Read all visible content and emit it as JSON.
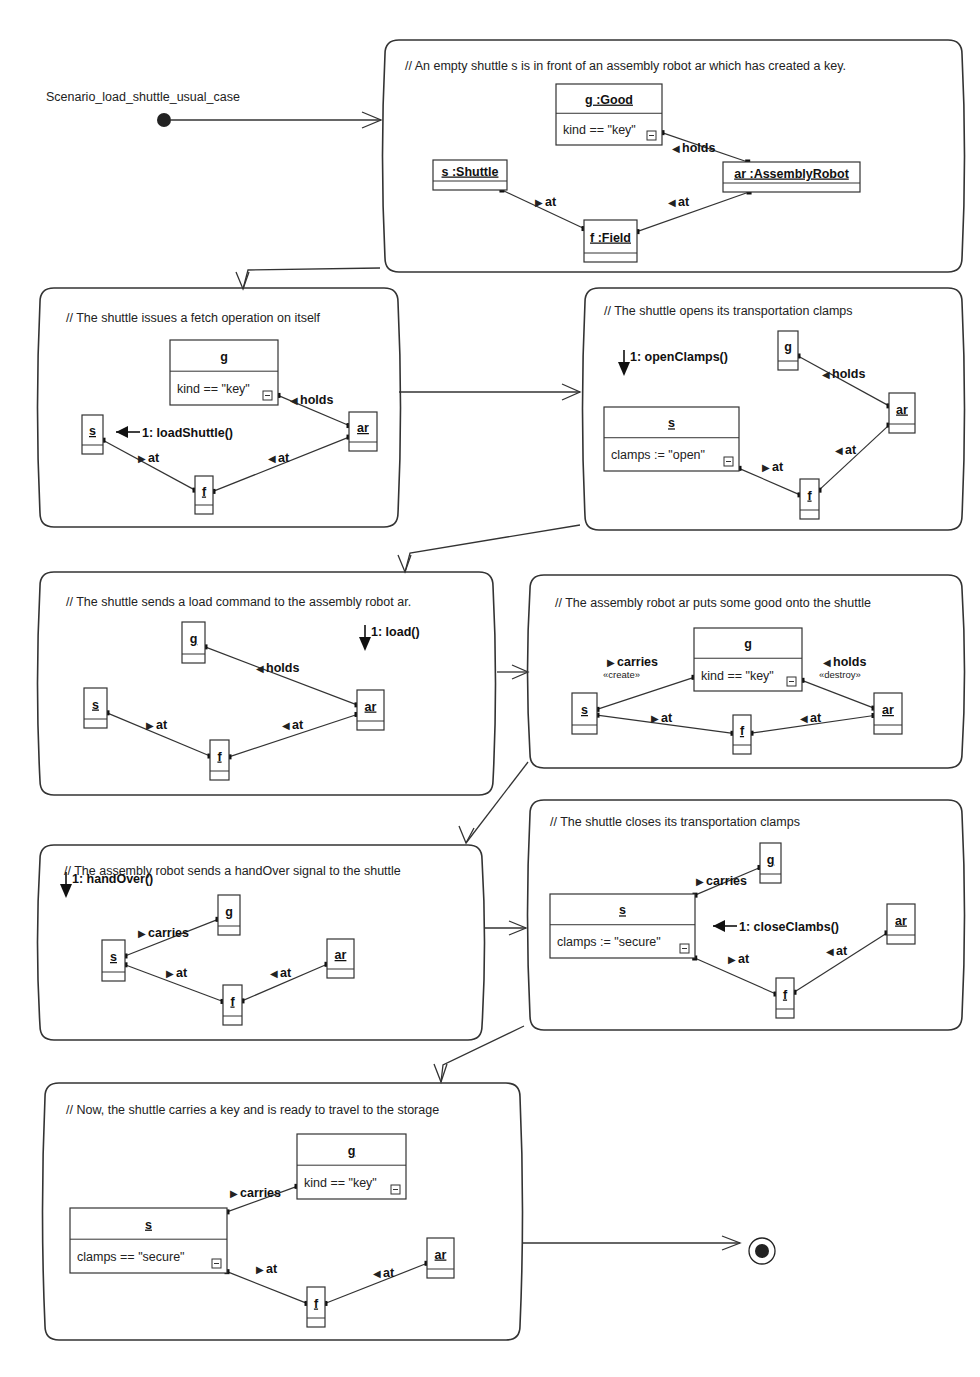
{
  "diagram": {
    "scenario_name": "Scenario_load_shuttle_usual_case",
    "frames": [
      {
        "id": "f1",
        "comment": "// An empty shuttle s is in front of an assembly robot ar which has created a key.",
        "objects": {
          "g": {
            "name": "g :Good",
            "attr": "kind == \"key\""
          },
          "s": {
            "name": "s :Shuttle"
          },
          "ar": {
            "name": "ar :AssemblyRobot"
          },
          "f": {
            "name": "f :Field"
          }
        },
        "links": [
          {
            "from": "g",
            "to": "ar",
            "label": "holds",
            "dir": "left"
          },
          {
            "from": "s",
            "to": "f",
            "label": "at",
            "dir": "right"
          },
          {
            "from": "ar",
            "to": "f",
            "label": "at",
            "dir": "left"
          }
        ]
      },
      {
        "id": "f2",
        "comment": "// The shuttle issues a fetch operation on itself",
        "objects": {
          "g": {
            "name": "g",
            "attr": "kind == \"key\""
          },
          "s": {
            "name": "s"
          },
          "ar": {
            "name": "ar"
          },
          "f": {
            "name": "f"
          }
        },
        "message": "1: loadShuttle()",
        "links": [
          {
            "from": "g",
            "to": "ar",
            "label": "holds",
            "dir": "left"
          },
          {
            "from": "s",
            "to": "f",
            "label": "at",
            "dir": "right"
          },
          {
            "from": "ar",
            "to": "f",
            "label": "at",
            "dir": "left"
          }
        ]
      },
      {
        "id": "f3",
        "comment": "// The shuttle opens its transportation clamps",
        "objects": {
          "g": {
            "name": "g"
          },
          "s": {
            "name": "s",
            "attr": "clamps := \"open\""
          },
          "ar": {
            "name": "ar"
          },
          "f": {
            "name": "f"
          }
        },
        "message": "1: openClamps()",
        "links": [
          {
            "from": "g",
            "to": "ar",
            "label": "holds",
            "dir": "left"
          },
          {
            "from": "s",
            "to": "f",
            "label": "at",
            "dir": "right"
          },
          {
            "from": "ar",
            "to": "f",
            "label": "at",
            "dir": "left"
          }
        ]
      },
      {
        "id": "f4",
        "comment": "// The shuttle sends a load command to the assembly robot ar.",
        "objects": {
          "g": {
            "name": "g"
          },
          "s": {
            "name": "s"
          },
          "ar": {
            "name": "ar"
          },
          "f": {
            "name": "f"
          }
        },
        "message": "1: load()",
        "links": [
          {
            "from": "g",
            "to": "ar",
            "label": "holds",
            "dir": "left"
          },
          {
            "from": "s",
            "to": "f",
            "label": "at",
            "dir": "right"
          },
          {
            "from": "ar",
            "to": "f",
            "label": "at",
            "dir": "left"
          }
        ]
      },
      {
        "id": "f5",
        "comment": "// The assembly robot ar puts some good onto the shuttle",
        "objects": {
          "g": {
            "name": "g",
            "attr": "kind == \"key\""
          },
          "s": {
            "name": "s"
          },
          "ar": {
            "name": "ar"
          },
          "f": {
            "name": "f"
          }
        },
        "links": [
          {
            "from": "s",
            "to": "g",
            "label": "carries",
            "dir": "right",
            "stereotype": "«create»"
          },
          {
            "from": "g",
            "to": "ar",
            "label": "holds",
            "dir": "left",
            "stereotype": "«destroy»"
          },
          {
            "from": "s",
            "to": "f",
            "label": "at",
            "dir": "right"
          },
          {
            "from": "ar",
            "to": "f",
            "label": "at",
            "dir": "left"
          }
        ]
      },
      {
        "id": "f6",
        "comment": "// The assembly robot sends a handOver signal to the shuttle",
        "objects": {
          "g": {
            "name": "g"
          },
          "s": {
            "name": "s"
          },
          "ar": {
            "name": "ar"
          },
          "f": {
            "name": "f"
          }
        },
        "message": "1: handOver()",
        "links": [
          {
            "from": "s",
            "to": "g",
            "label": "carries",
            "dir": "right"
          },
          {
            "from": "s",
            "to": "f",
            "label": "at",
            "dir": "right"
          },
          {
            "from": "ar",
            "to": "f",
            "label": "at",
            "dir": "left"
          }
        ]
      },
      {
        "id": "f7",
        "comment": "// The shuttle closes its transportation clamps",
        "objects": {
          "g": {
            "name": "g"
          },
          "s": {
            "name": "s",
            "attr": "clamps := \"secure\""
          },
          "ar": {
            "name": "ar"
          },
          "f": {
            "name": "f"
          }
        },
        "message": "1: closeClambs()",
        "links": [
          {
            "from": "s",
            "to": "g",
            "label": "carries",
            "dir": "right"
          },
          {
            "from": "s",
            "to": "f",
            "label": "at",
            "dir": "right"
          },
          {
            "from": "ar",
            "to": "f",
            "label": "at",
            "dir": "left"
          }
        ]
      },
      {
        "id": "f8",
        "comment": "// Now, the shuttle carries a key and is ready to travel to the storage",
        "objects": {
          "g": {
            "name": "g",
            "attr": "kind == \"key\""
          },
          "s": {
            "name": "s",
            "attr": "clamps == \"secure\""
          },
          "ar": {
            "name": "ar"
          },
          "f": {
            "name": "f"
          }
        },
        "links": [
          {
            "from": "s",
            "to": "g",
            "label": "carries",
            "dir": "right"
          },
          {
            "from": "s",
            "to": "f",
            "label": "at",
            "dir": "right"
          },
          {
            "from": "ar",
            "to": "f",
            "label": "at",
            "dir": "left"
          }
        ]
      }
    ],
    "icons": {
      "initial_state": "filled-circle",
      "final_state": "bullseye",
      "collapse": "collapse-box-icon",
      "link_direction_right": "▶",
      "link_direction_left": "◀"
    }
  }
}
